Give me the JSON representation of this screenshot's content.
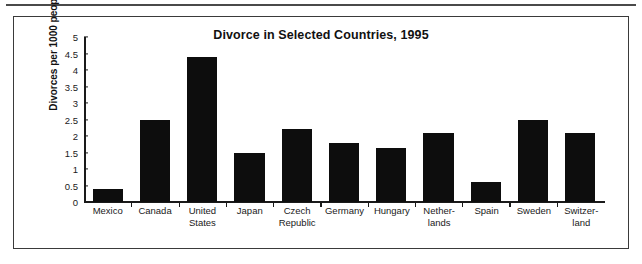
{
  "figure": {
    "title": "Divorce in Selected Countries, 1995",
    "frame_color": "#3a3a3a",
    "bar_color": "#0d0d0d",
    "background": "#ffffff"
  },
  "chart_data": {
    "type": "bar",
    "title": "Divorce in Selected Countries, 1995",
    "xlabel": "",
    "ylabel": "Divorces per 1000 people",
    "ylim": [
      0,
      5
    ],
    "ytick_step": 0.5,
    "yticks": [
      "0",
      "0.5",
      "1",
      "1.5",
      "2",
      "2.5",
      "3",
      "3.5",
      "4",
      "4.5",
      "5"
    ],
    "grid": false,
    "legend": null,
    "categories": [
      "Mexico",
      "Canada",
      "United States",
      "Japan",
      "Czech Republic",
      "Germany",
      "Hungary",
      "Netherlands",
      "Spain",
      "Sweden",
      "Switzerland"
    ],
    "category_lines": [
      [
        "Mexico"
      ],
      [
        "Canada"
      ],
      [
        "United",
        "States"
      ],
      [
        "Japan"
      ],
      [
        "Czech",
        "Republic"
      ],
      [
        "Germany"
      ],
      [
        "Hungary"
      ],
      [
        "Nether-",
        "lands"
      ],
      [
        "Spain"
      ],
      [
        "Sweden"
      ],
      [
        "Switzer-",
        "land"
      ]
    ],
    "values": [
      0.4,
      2.5,
      4.4,
      1.5,
      2.2,
      1.8,
      1.65,
      2.1,
      0.6,
      2.5,
      2.1
    ]
  }
}
